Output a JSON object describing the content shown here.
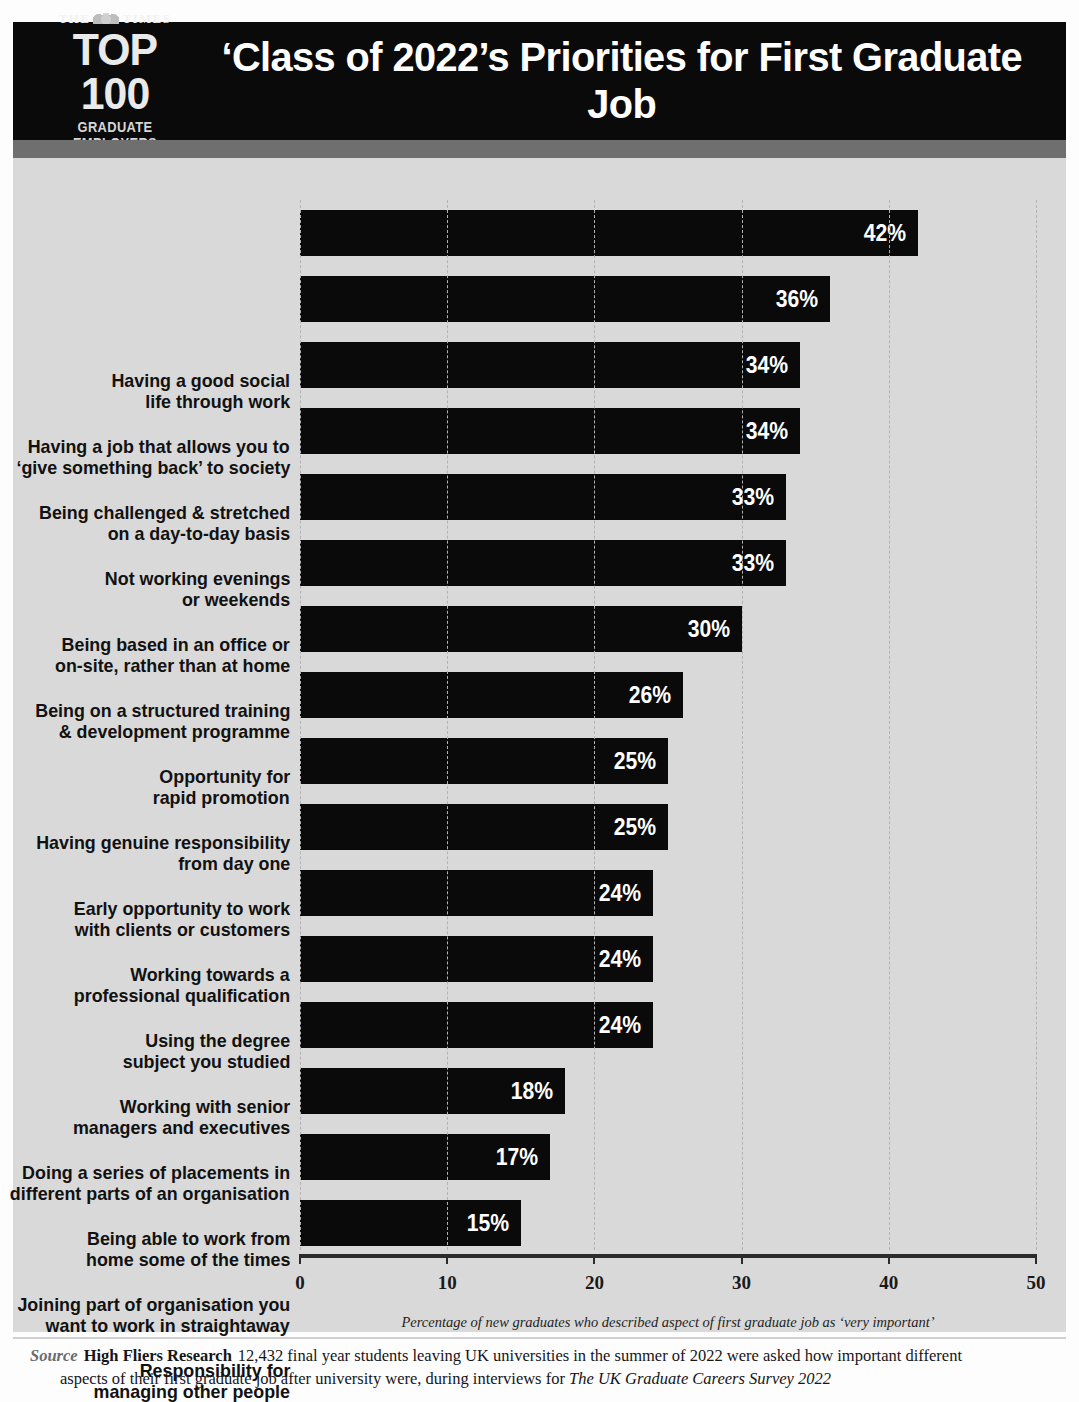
{
  "header": {
    "brand_the": "THE",
    "brand_times": "TIMES",
    "brand_top": "TOP 100",
    "brand_sub": "GRADUATE EMPLOYERS",
    "crest_icon": "times-crest-icon",
    "headline": "‘Class of 2022’s Priorities for First Graduate Job"
  },
  "footer": {
    "source_word": "Source",
    "source_org": "High Fliers Research",
    "source_text_1": "12,432 final year students leaving UK universities in the summer of 2022 were asked how important different",
    "source_text_2a": "aspects of their first graduate job after university were, during interviews for ",
    "source_text_2b": "The UK Graduate Careers Survey 2022"
  },
  "chart_data": {
    "type": "bar",
    "orientation": "horizontal",
    "title": "‘Class of 2022’s Priorities for First Graduate Job",
    "xlabel": "Percentage of new graduates who described aspect of first graduate job as ‘very important’",
    "ylabel": "",
    "xlim": [
      0,
      50
    ],
    "xticks": [
      0,
      10,
      20,
      30,
      40,
      50
    ],
    "xtick_labels": [
      "0",
      "10",
      "20",
      "30",
      "40",
      "50"
    ],
    "grid": "vertical-dashed",
    "legend": "none",
    "bar_color": "#0a0a0a",
    "background_color": "#d9d9d9",
    "categories": [
      "Having a good social life through work",
      "Having a job that allows you to ‘give something back’ to society",
      "Being challenged & stretched on a day-to-day basis",
      "Not working evenings or weekends",
      "Being based in an office or on-site, rather than at home",
      "Being on a structured training & development programme",
      "Opportunity for rapid promotion",
      "Having genuine responsibility from day one",
      "Early opportunity to work with clients or customers",
      "Working towards a professional qualification",
      "Using the degree subject you studied",
      "Working with senior managers and executives",
      "Doing a series of placements in different parts of an organisation",
      "Being able to work from home some of the times",
      "Joining part of organisation you want to work in straightaway",
      "Responsibility for managing other people"
    ],
    "values": [
      42,
      36,
      34,
      34,
      33,
      33,
      30,
      26,
      25,
      25,
      24,
      24,
      24,
      18,
      17,
      15
    ],
    "value_labels": [
      "42%",
      "36%",
      "34%",
      "34%",
      "33%",
      "33%",
      "30%",
      "26%",
      "25%",
      "25%",
      "24%",
      "24%",
      "24%",
      "18%",
      "17%",
      "15%"
    ],
    "category_lines": [
      [
        "Having a good social",
        "life through work"
      ],
      [
        "Having a job that allows you to",
        "‘give something back’ to society"
      ],
      [
        "Being challenged & stretched",
        "on a day-to-day basis"
      ],
      [
        "Not working evenings",
        "or weekends"
      ],
      [
        "Being based in an office or",
        "on-site, rather than at home"
      ],
      [
        "Being on a structured training",
        "& development programme"
      ],
      [
        "Opportunity for",
        "rapid promotion"
      ],
      [
        "Having genuine responsibility",
        "from day one"
      ],
      [
        "Early opportunity to work",
        "with clients or customers"
      ],
      [
        "Working towards a",
        "professional qualification"
      ],
      [
        "Using the degree",
        "subject you studied"
      ],
      [
        "Working with senior",
        "managers and executives"
      ],
      [
        "Doing a series of placements in",
        "different parts of an organisation"
      ],
      [
        "Being able to work from",
        "home some of the times"
      ],
      [
        "Joining part of organisation you",
        "want to work in straightaway"
      ],
      [
        "Responsibility for",
        "managing other people"
      ]
    ]
  }
}
